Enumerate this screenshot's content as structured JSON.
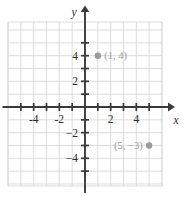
{
  "chart_data": {
    "type": "scatter",
    "title": "",
    "xlabel": "x",
    "ylabel": "y",
    "xlim": [
      -6,
      6
    ],
    "ylim": [
      -6.4,
      6.4
    ],
    "grid": true,
    "legend": "none",
    "x_ticks": [
      -4,
      -2,
      2,
      4
    ],
    "y_ticks": [
      4,
      2,
      -2,
      -4
    ],
    "x_tick_labels": [
      "-4",
      "-2",
      "2",
      "4"
    ],
    "y_tick_labels": [
      "4",
      "2",
      "−2",
      "−4"
    ],
    "x_minor_ticks": [
      -5,
      -4,
      -3,
      -2,
      -1,
      1,
      2,
      3,
      4,
      5
    ],
    "y_minor_ticks": [
      5,
      4,
      3,
      2,
      1,
      -1,
      -2,
      -3,
      -4,
      -5
    ],
    "points": [
      {
        "x": 1,
        "y": 4,
        "label": "(1, 4)",
        "label_side": "right"
      },
      {
        "x": 5,
        "y": -3,
        "label": "(5, −3)",
        "label_side": "left"
      }
    ],
    "colors": {
      "grid": "#d8d8d8",
      "axis": "#3a3a3a",
      "point": "#9b9b9b",
      "point_label": "#9b9b9b",
      "tick_label": "#2b2b2b",
      "background": "#ffffff"
    }
  }
}
